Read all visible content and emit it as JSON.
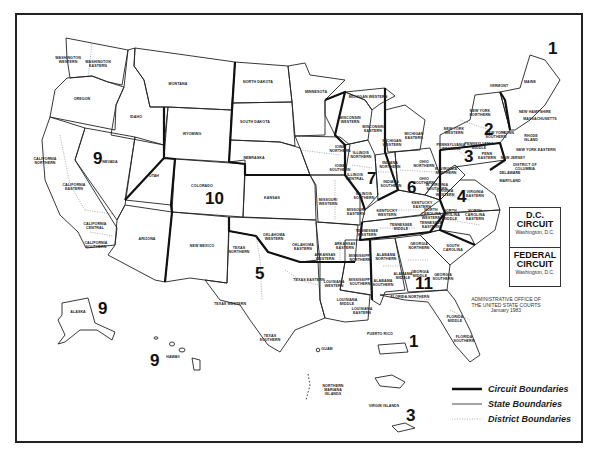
{
  "map": {
    "subject": "United States Courts of Appeals and District Courts",
    "credit": {
      "line1": "ADMINISTRATIVE OFFICE OF",
      "line2": "THE UNITED STATE COURTS",
      "date": "January 1983"
    },
    "special_circuits": [
      {
        "title1": "D.C.",
        "title2": "CIRCUIT",
        "location": "Washington, D.C."
      },
      {
        "title1": "FEDERAL",
        "title2": "CIRCUIT",
        "location": "Washington, D.C."
      }
    ],
    "legend": [
      {
        "label": "Circuit Boundaries",
        "style": "thick"
      },
      {
        "label": "State Boundaries",
        "style": "thin"
      },
      {
        "label": "District Boundaries",
        "style": "dotted"
      }
    ],
    "circuit_numbers": [
      {
        "n": "1",
        "x": 548,
        "y": 40
      },
      {
        "n": "2",
        "x": 484,
        "y": 121
      },
      {
        "n": "3",
        "x": 464,
        "y": 148
      },
      {
        "n": "4",
        "x": 457,
        "y": 188
      },
      {
        "n": "5",
        "x": 255,
        "y": 265
      },
      {
        "n": "6",
        "x": 407,
        "y": 179
      },
      {
        "n": "7",
        "x": 367,
        "y": 170
      },
      {
        "n": "9",
        "x": 93,
        "y": 150
      },
      {
        "n": "9",
        "x": 98,
        "y": 300
      },
      {
        "n": "9",
        "x": 150,
        "y": 352
      },
      {
        "n": "10",
        "x": 205,
        "y": 190
      },
      {
        "n": "11",
        "x": 415,
        "y": 275
      },
      {
        "n": "1",
        "x": 409,
        "y": 333
      },
      {
        "n": "3",
        "x": 406,
        "y": 407
      }
    ],
    "districts": [
      {
        "t": "WASHINGTON\nWESTERN",
        "x": 68,
        "y": 59
      },
      {
        "t": "WASHINGTON\nEASTERN",
        "x": 98,
        "y": 63
      },
      {
        "t": "OREGON",
        "x": 82,
        "y": 100
      },
      {
        "t": "IDAHO",
        "x": 136,
        "y": 118
      },
      {
        "t": "MONTANA",
        "x": 178,
        "y": 85
      },
      {
        "t": "WYOMING",
        "x": 192,
        "y": 135
      },
      {
        "t": "NORTH DAKOTA",
        "x": 258,
        "y": 83
      },
      {
        "t": "SOUTH DAKOTA",
        "x": 255,
        "y": 123
      },
      {
        "t": "MINNESOTA",
        "x": 316,
        "y": 93
      },
      {
        "t": "NEBRASKA",
        "x": 254,
        "y": 159
      },
      {
        "t": "CALIFORNIA\nNORTHERN",
        "x": 45,
        "y": 160
      },
      {
        "t": "NEVADA",
        "x": 110,
        "y": 163
      },
      {
        "t": "CALIFORNIA\nEASTERN",
        "x": 74,
        "y": 186
      },
      {
        "t": "CALIFORNIA CENTRAL",
        "x": 95,
        "y": 225
      },
      {
        "t": "CALIFORNIA\nSOUTHERN",
        "x": 96,
        "y": 244
      },
      {
        "t": "UTAH",
        "x": 154,
        "y": 177
      },
      {
        "t": "COLORADO",
        "x": 202,
        "y": 187
      },
      {
        "t": "KANSAS",
        "x": 272,
        "y": 199
      },
      {
        "t": "ARIZONA",
        "x": 147,
        "y": 240
      },
      {
        "t": "NEW MEXICO",
        "x": 202,
        "y": 247
      },
      {
        "t": "OKLAHOMA\nWESTERN",
        "x": 274,
        "y": 236
      },
      {
        "t": "OKLAHOMA\nEASTERN",
        "x": 303,
        "y": 246
      },
      {
        "t": "TEXAS\nNORTHERN",
        "x": 239,
        "y": 249
      },
      {
        "t": "TEXAS EASTERN",
        "x": 309,
        "y": 281
      },
      {
        "t": "TEXAS WESTERN",
        "x": 230,
        "y": 305
      },
      {
        "t": "TEXAS\nSOUTHERN",
        "x": 270,
        "y": 337
      },
      {
        "t": "IOWA\nNORTHERN",
        "x": 340,
        "y": 148
      },
      {
        "t": "IOWA\nSOUTHERN",
        "x": 340,
        "y": 167
      },
      {
        "t": "MISSOURI\nWESTERN",
        "x": 328,
        "y": 201
      },
      {
        "t": "MISSOURI\nEASTERN",
        "x": 356,
        "y": 211
      },
      {
        "t": "ARKANSAS\nEASTERN",
        "x": 345,
        "y": 245
      },
      {
        "t": "ARKANSAS\nWESTERN",
        "x": 325,
        "y": 256
      },
      {
        "t": "LOUISIANA\nWESTERN",
        "x": 334,
        "y": 283
      },
      {
        "t": "LOUISIANA\nMIDDLE",
        "x": 347,
        "y": 301
      },
      {
        "t": "LOUISIANA\nEASTERN",
        "x": 362,
        "y": 310
      },
      {
        "t": "MISSISSIPPI\nNORTHERN",
        "x": 360,
        "y": 257
      },
      {
        "t": "MISSISSIPPI\nSOUTHERN",
        "x": 360,
        "y": 281
      },
      {
        "t": "WISCONSIN\nWESTERN",
        "x": 350,
        "y": 119
      },
      {
        "t": "WISCONSIN\nEASTERN",
        "x": 373,
        "y": 128
      },
      {
        "t": "MICHIGAN WESTERN",
        "x": 368,
        "y": 98
      },
      {
        "t": "MICHIGAN\nEASTERN",
        "x": 414,
        "y": 135
      },
      {
        "t": "MICHIGAN\nWESTERN",
        "x": 392,
        "y": 142
      },
      {
        "t": "ILLINOIS\nNORTHERN",
        "x": 361,
        "y": 154
      },
      {
        "t": "ILLINOIS\nCENTRAL",
        "x": 355,
        "y": 176
      },
      {
        "t": "ILLINOIS\nSOUTHERN",
        "x": 364,
        "y": 195
      },
      {
        "t": "INDIANA\nNORTHERN",
        "x": 390,
        "y": 164
      },
      {
        "t": "INDIANA\nSOUTHERN",
        "x": 391,
        "y": 183
      },
      {
        "t": "OHIO\nNORTHERN",
        "x": 424,
        "y": 163
      },
      {
        "t": "OHIO\nSOUTHERN",
        "x": 424,
        "y": 180
      },
      {
        "t": "KENTUCKY\nWESTERN",
        "x": 387,
        "y": 212
      },
      {
        "t": "KENTUCKY\nEASTERN",
        "x": 422,
        "y": 204
      },
      {
        "t": "TENNESSEE\nWESTERN",
        "x": 367,
        "y": 232
      },
      {
        "t": "TENNESSEE\nMIDDLE",
        "x": 401,
        "y": 226
      },
      {
        "t": "TENNESSEE\nEASTERN",
        "x": 431,
        "y": 224
      },
      {
        "t": "ALABAMA\nNORTHERN",
        "x": 386,
        "y": 256
      },
      {
        "t": "ALABAMA\nMIDDLE",
        "x": 403,
        "y": 275
      },
      {
        "t": "ALABAMA\nSOUTHERN",
        "x": 383,
        "y": 282
      },
      {
        "t": "GEORGIA\nNORTHERN",
        "x": 419,
        "y": 245
      },
      {
        "t": "GEORGIA\nMIDDLE",
        "x": 420,
        "y": 273
      },
      {
        "t": "GEORGIA\nSOUTHERN",
        "x": 443,
        "y": 276
      },
      {
        "t": "FLORIDA NORTHERN",
        "x": 410,
        "y": 298
      },
      {
        "t": "FLORIDA\nMIDDLE",
        "x": 455,
        "y": 318
      },
      {
        "t": "FLORIDA\nSOUTHERN",
        "x": 464,
        "y": 338
      },
      {
        "t": "SOUTH\nCAROLINA",
        "x": 453,
        "y": 247
      },
      {
        "t": "NORTH\nCAROLINA\nWESTERN",
        "x": 431,
        "y": 211
      },
      {
        "t": "NORTH\nCAROLINA\nMIDDLE",
        "x": 450,
        "y": 212
      },
      {
        "t": "NORTH\nCAROLINA\nEASTERN",
        "x": 475,
        "y": 212
      },
      {
        "t": "VIRGINIA\nWESTERN",
        "x": 445,
        "y": 192
      },
      {
        "t": "VIRGINIA\nEASTERN",
        "x": 475,
        "y": 193
      },
      {
        "t": "W. VIRGINIA\nNORTHERN",
        "x": 446,
        "y": 170
      },
      {
        "t": "W. VIRGINIA\nSOUTHERN",
        "x": 437,
        "y": 186
      },
      {
        "t": "PENNSYLVANIA\nWESTERN",
        "x": 451,
        "y": 146
      },
      {
        "t": "PENNSYLVANIA\nMIDDLE",
        "x": 479,
        "y": 145
      },
      {
        "t": "PENN\nEASTERN",
        "x": 487,
        "y": 155
      },
      {
        "t": "NEW YORK\nWESTERN",
        "x": 454,
        "y": 130
      },
      {
        "t": "NEW YORK\nNORTHERN",
        "x": 480,
        "y": 112
      },
      {
        "t": "NEW YORK\nSOUTHERN",
        "x": 496,
        "y": 134
      },
      {
        "t": "CONN.",
        "x": 509,
        "y": 134
      },
      {
        "t": "RHODE\nISLAND",
        "x": 531,
        "y": 137
      },
      {
        "t": "NEW YORK EASTERN",
        "x": 536,
        "y": 151
      },
      {
        "t": "NEW JERSEY",
        "x": 513,
        "y": 159
      },
      {
        "t": "DISTRICT OF COLUMBIA",
        "x": 525,
        "y": 166
      },
      {
        "t": "DELAWARE",
        "x": 510,
        "y": 174
      },
      {
        "t": "MARYLAND",
        "x": 510,
        "y": 182
      },
      {
        "t": "VERMONT",
        "x": 499,
        "y": 87
      },
      {
        "t": "MAINE",
        "x": 530,
        "y": 83
      },
      {
        "t": "NEW HAMPSHIRE",
        "x": 535,
        "y": 113
      },
      {
        "t": "MASSACHUSETTS",
        "x": 540,
        "y": 120
      },
      {
        "t": "ALASKA",
        "x": 78,
        "y": 313
      },
      {
        "t": "HAWAII",
        "x": 173,
        "y": 358
      },
      {
        "t": "GUAM",
        "x": 327,
        "y": 350
      },
      {
        "t": "PUERTO RICO",
        "x": 380,
        "y": 335
      },
      {
        "t": "NORTHERN\nMARIANA\nISLANDS",
        "x": 333,
        "y": 387
      },
      {
        "t": "VIRGIN ISLANDS",
        "x": 384,
        "y": 407
      }
    ]
  }
}
